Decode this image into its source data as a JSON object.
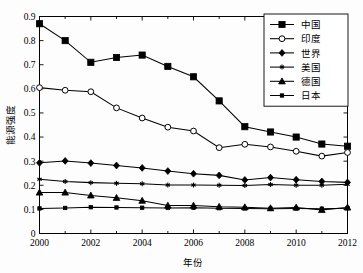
{
  "chart_data": {
    "type": "line",
    "title": "",
    "xlabel": "年份",
    "ylabel": "能源强度",
    "xlim": [
      2000,
      2012
    ],
    "ylim": [
      0,
      0.9
    ],
    "grid": false,
    "legend_position": "top-right",
    "x": [
      2000,
      2001,
      2002,
      2003,
      2004,
      2005,
      2006,
      2007,
      2008,
      2009,
      2010,
      2011,
      2012
    ],
    "xticks": [
      "2000",
      "2002",
      "2004",
      "2006",
      "2008",
      "2010",
      "2012"
    ],
    "xtick_values": [
      2000,
      2002,
      2004,
      2006,
      2008,
      2010,
      2012
    ],
    "yticks": [
      "0",
      "0.1",
      "0.2",
      "0.3",
      "0.4",
      "0.5",
      "0.6",
      "0.7",
      "0.8",
      "0.9"
    ],
    "ytick_values": [
      0,
      0.1,
      0.2,
      0.3,
      0.4,
      0.5,
      0.6,
      0.7,
      0.8,
      0.9
    ],
    "series": [
      {
        "name": "中国",
        "marker": "filled-square",
        "values": [
          0.87,
          0.8,
          0.71,
          0.73,
          0.74,
          0.693,
          0.65,
          0.55,
          0.443,
          0.421,
          0.4,
          0.371,
          0.362
        ]
      },
      {
        "name": "印度",
        "marker": "open-circle",
        "values": [
          0.605,
          0.594,
          0.588,
          0.521,
          0.479,
          0.441,
          0.425,
          0.356,
          0.37,
          0.359,
          0.341,
          0.321,
          0.336
        ]
      },
      {
        "name": "世界",
        "marker": "filled-diamond",
        "values": [
          0.293,
          0.301,
          0.292,
          0.282,
          0.272,
          0.259,
          0.248,
          0.241,
          0.222,
          0.232,
          0.223,
          0.216,
          0.212
        ]
      },
      {
        "name": "美国",
        "marker": "star",
        "values": [
          0.225,
          0.216,
          0.211,
          0.208,
          0.206,
          0.201,
          0.201,
          0.2,
          0.199,
          0.203,
          0.2,
          0.2,
          0.204
        ]
      },
      {
        "name": "德国",
        "marker": "filled-triangle",
        "values": [
          0.17,
          0.17,
          0.158,
          0.148,
          0.136,
          0.116,
          0.116,
          0.111,
          0.109,
          0.105,
          0.108,
          0.098,
          0.108
        ]
      },
      {
        "name": "日本",
        "marker": "small-square",
        "values": [
          0.104,
          0.106,
          0.109,
          0.108,
          0.107,
          0.106,
          0.107,
          0.105,
          0.104,
          0.103,
          0.104,
          0.103,
          0.105
        ]
      }
    ]
  },
  "legend": {
    "entries": [
      "中国",
      "印度",
      "世界",
      "美国",
      "德国",
      "日本"
    ]
  },
  "colors": {
    "line": "#000000",
    "background": "#ffffff",
    "axis": "#000000"
  }
}
